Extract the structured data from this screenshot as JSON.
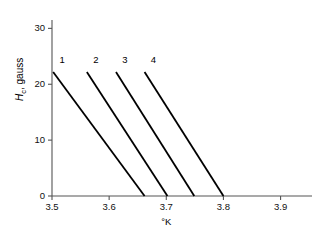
{
  "chart_data": {
    "type": "line",
    "title": "",
    "xlabel": "°K",
    "ylabel": "H_c, gauss",
    "ylabel_main": "H",
    "ylabel_sub": "c",
    "ylabel_rest": ", gauss",
    "xlim": [
      3.5,
      3.955
    ],
    "ylim": [
      0,
      31.5
    ],
    "xticks": [
      3.5,
      3.6,
      3.7,
      3.8,
      3.9
    ],
    "xtick_labels": [
      "3.5",
      "3.6",
      "3.7",
      "3.8",
      "3.9"
    ],
    "yticks": [
      0,
      10,
      20,
      30
    ],
    "ytick_labels": [
      "0",
      "10",
      "20",
      "30"
    ],
    "grid": false,
    "legend": "inline curve numbers at top of each line",
    "series": [
      {
        "name": "1",
        "label": "1",
        "x": [
          3.502,
          3.662
        ],
        "y": [
          22.2,
          0.0
        ],
        "label_x": 3.513,
        "label_y": 24.3
      },
      {
        "name": "2",
        "label": "2",
        "x": [
          3.561,
          3.702
        ],
        "y": [
          22.2,
          0.0
        ],
        "label_x": 3.572,
        "label_y": 24.3
      },
      {
        "name": "3",
        "label": "3",
        "x": [
          3.612,
          3.749
        ],
        "y": [
          22.2,
          0.0
        ],
        "label_x": 3.623,
        "label_y": 24.3
      },
      {
        "name": "4",
        "label": "4",
        "x": [
          3.662,
          3.8
        ],
        "y": [
          22.2,
          0.0
        ],
        "label_x": 3.673,
        "label_y": 24.3
      }
    ]
  }
}
